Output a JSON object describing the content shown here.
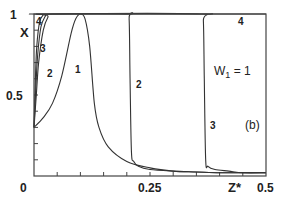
{
  "chart_data": {
    "type": "line",
    "title": "",
    "xlabel": "Z*",
    "ylabel": "X",
    "xlim": [
      0,
      0.5
    ],
    "ylim": [
      0,
      1
    ],
    "grid": false,
    "x_ticks": [
      0,
      0.25,
      0.5
    ],
    "x_tick_labels": [
      "0",
      "0.25",
      "0.5"
    ],
    "x_minor_step": 0.05,
    "y_ticks": [
      0.5,
      1
    ],
    "y_tick_labels": [
      "0.5",
      "1"
    ],
    "y_minor_step": 0.1,
    "annotations": [
      "W1 = 1",
      "(b)"
    ],
    "series": [
      {
        "name": "1",
        "x": [
          0,
          0.02,
          0.04,
          0.06,
          0.08,
          0.09,
          0.1,
          0.11,
          0.12,
          0.13,
          0.14,
          0.16,
          0.2,
          0.25,
          0.3,
          0.35,
          0.4,
          0.45,
          0.5
        ],
        "y": [
          0.3,
          0.36,
          0.45,
          0.62,
          0.88,
          0.97,
          1.0,
          0.97,
          0.8,
          0.45,
          0.3,
          0.18,
          0.09,
          0.05,
          0.03,
          0.025,
          0.02,
          0.02,
          0.02
        ]
      },
      {
        "name": "2",
        "x": [
          0,
          0.005,
          0.01,
          0.02,
          0.03,
          0.04,
          0.2,
          0.205,
          0.207,
          0.21,
          0.215,
          0.225,
          0.25,
          0.3,
          0.35,
          0.4,
          0.45,
          0.5
        ],
        "y": [
          0.3,
          0.5,
          0.7,
          0.9,
          0.98,
          1.0,
          1.0,
          0.97,
          0.6,
          0.15,
          0.09,
          0.06,
          0.04,
          0.03,
          0.025,
          0.02,
          0.02,
          0.02
        ]
      },
      {
        "name": "3",
        "x": [
          0,
          0.004,
          0.008,
          0.015,
          0.025,
          0.03,
          0.36,
          0.365,
          0.367,
          0.37,
          0.375,
          0.39,
          0.42,
          0.45,
          0.5
        ],
        "y": [
          0.3,
          0.55,
          0.75,
          0.92,
          0.99,
          1.0,
          1.0,
          0.96,
          0.6,
          0.1,
          0.06,
          0.04,
          0.03,
          0.02,
          0.02
        ]
      },
      {
        "name": "4",
        "x": [
          0,
          0.003,
          0.006,
          0.012,
          0.02,
          0.025,
          0.5
        ],
        "y": [
          0.3,
          0.6,
          0.8,
          0.95,
          0.995,
          1.0,
          1.0
        ]
      }
    ]
  },
  "labels": {
    "y_axis": "X",
    "x_axis": "Z*",
    "y_top": "1",
    "y_mid": "0.5",
    "x_0": "0",
    "x_mid": "0.25",
    "x_end": "0.5",
    "param_w": "W",
    "param_sub": "1",
    "param_val": " = 1",
    "panel": "(b)",
    "curve_1": "1",
    "curve_2a": "2",
    "curve_2b": "2",
    "curve_3a": "3",
    "curve_3b": "3",
    "curve_4a": "4",
    "curve_4b": "4"
  }
}
